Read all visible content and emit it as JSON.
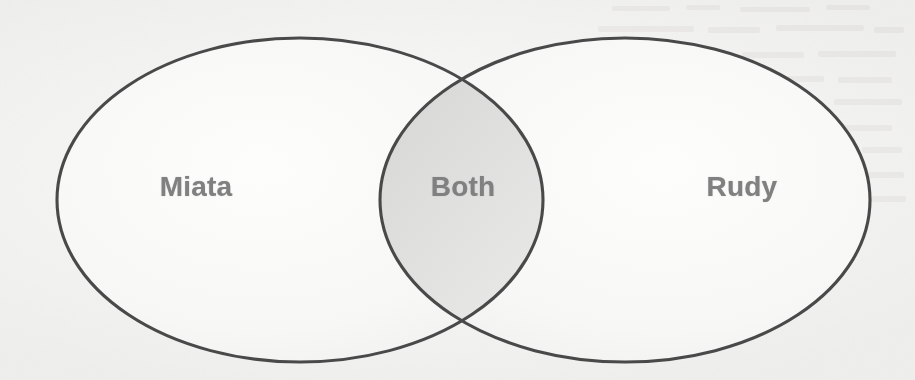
{
  "diagram": {
    "type": "venn",
    "title": "",
    "background_color": "#f3f3f2",
    "stroke_color": "#4a4a4a",
    "label_color": "#808080",
    "sets": [
      {
        "id": "left",
        "label": "Miata",
        "region": "left-only",
        "label_x": 196,
        "label_y": 187,
        "cx": 300,
        "cy": 200,
        "rx": 243,
        "ry": 162
      },
      {
        "id": "right",
        "label": "Rudy",
        "region": "right-only",
        "label_x": 742,
        "label_y": 187,
        "cx": 625,
        "cy": 200,
        "rx": 245,
        "ry": 162
      }
    ],
    "intersection": {
      "id": "both",
      "label": "Both",
      "region": "overlap",
      "label_x": 463,
      "label_y": 187,
      "shaded": true
    }
  }
}
